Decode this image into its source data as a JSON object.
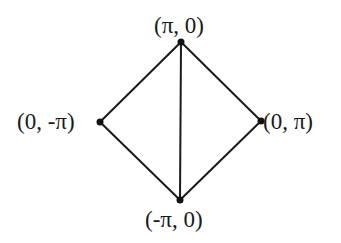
{
  "diagram": {
    "colors": {
      "edge": "#1a1a1a",
      "node": "#111111",
      "background": "#ffffff"
    },
    "nodes": [
      {
        "id": "top",
        "label": "(π, 0)",
        "x": 181,
        "y": 42
      },
      {
        "id": "left",
        "label": "(0, -π)",
        "x": 100,
        "y": 122
      },
      {
        "id": "right",
        "label": "(0, π)",
        "x": 261,
        "y": 121
      },
      {
        "id": "bottom",
        "label": "(-π, 0)",
        "x": 180,
        "y": 200
      }
    ],
    "edges": [
      [
        "top",
        "left"
      ],
      [
        "top",
        "right"
      ],
      [
        "top",
        "bottom"
      ],
      [
        "left",
        "bottom"
      ],
      [
        "right",
        "bottom"
      ]
    ]
  }
}
